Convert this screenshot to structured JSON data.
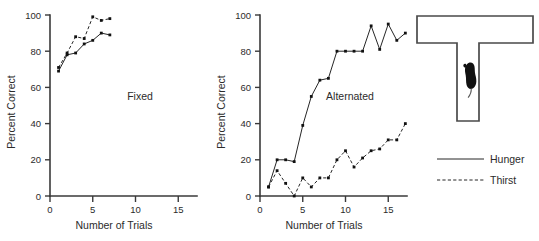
{
  "figure": {
    "background": "#ffffff",
    "ink": "#262626"
  },
  "panels": [
    {
      "name": "fixed",
      "label": "Fixed",
      "xlabel": "Number of Trials",
      "ylabel": "Percent Correct",
      "xticks": [
        0,
        5,
        10,
        15
      ],
      "yticks": [
        0,
        20,
        40,
        60,
        80,
        100
      ],
      "xlim": [
        0,
        17
      ],
      "ylim": [
        0,
        100
      ]
    },
    {
      "name": "alternated",
      "label": "Alternated",
      "xlabel": "Number of Trials",
      "ylabel": "Percent Correct",
      "xticks": [
        0,
        5,
        10,
        15
      ],
      "yticks": [
        0,
        20,
        40,
        60,
        80,
        100
      ],
      "xlim": [
        0,
        17
      ],
      "ylim": [
        0,
        100
      ]
    }
  ],
  "legend": {
    "items": [
      {
        "label": "Hunger",
        "style": "solid"
      },
      {
        "label": "Thirst",
        "style": "dashed"
      }
    ]
  },
  "diagram": {
    "name": "t-maze",
    "animal": "rat-silhouette"
  },
  "chart_data": [
    {
      "type": "line",
      "title": "Fixed",
      "xlabel": "Number of Trials",
      "ylabel": "Percent Correct",
      "xlim": [
        0,
        17
      ],
      "ylim": [
        0,
        100
      ],
      "xticks": [
        0,
        5,
        10,
        15
      ],
      "yticks": [
        0,
        20,
        40,
        60,
        80,
        100
      ],
      "grid": false,
      "legend_position": "external-right",
      "annotations": [
        "Fixed"
      ],
      "series": [
        {
          "name": "Hunger",
          "style": "solid",
          "x": [
            1,
            2,
            3,
            4,
            5,
            6,
            7
          ],
          "values": [
            69,
            78,
            79,
            84,
            86,
            90,
            89
          ]
        },
        {
          "name": "Thirst",
          "style": "dashed",
          "x": [
            1,
            2,
            3,
            4,
            5,
            6,
            7
          ],
          "values": [
            71,
            79,
            88,
            87,
            99,
            97,
            98
          ]
        }
      ]
    },
    {
      "type": "line",
      "title": "Alternated",
      "xlabel": "Number of Trials",
      "ylabel": "Percent Correct",
      "xlim": [
        0,
        17
      ],
      "ylim": [
        0,
        100
      ],
      "xticks": [
        0,
        5,
        10,
        15
      ],
      "yticks": [
        0,
        20,
        40,
        60,
        80,
        100
      ],
      "grid": false,
      "legend_position": "external-right",
      "annotations": [
        "Alternated"
      ],
      "series": [
        {
          "name": "Hunger",
          "style": "solid",
          "x": [
            1,
            2,
            3,
            4,
            5,
            6,
            7,
            8,
            9,
            10,
            11,
            12,
            13,
            14,
            15,
            16,
            17
          ],
          "values": [
            5,
            20,
            20,
            19,
            39,
            55,
            64,
            65,
            80,
            80,
            80,
            80,
            94,
            81,
            95,
            86,
            90
          ]
        },
        {
          "name": "Thirst",
          "style": "dashed",
          "x": [
            1,
            2,
            3,
            4,
            5,
            6,
            7,
            8,
            9,
            10,
            11,
            12,
            13,
            14,
            15,
            16,
            17
          ],
          "values": [
            5,
            14,
            7,
            0,
            10,
            5,
            10,
            10,
            20,
            25,
            16,
            21,
            25,
            26,
            31,
            31,
            40
          ]
        }
      ]
    }
  ]
}
